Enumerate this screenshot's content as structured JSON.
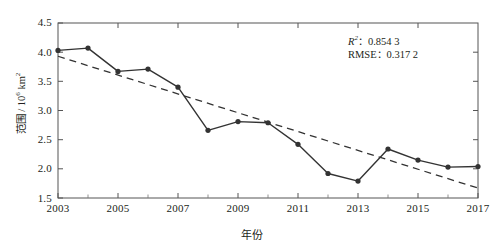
{
  "chart_data": {
    "type": "line",
    "title": "",
    "subtitle": "",
    "xlabel": "年份",
    "ylabel": "范围 / 10⁶ km²",
    "ylabel_parts": {
      "text": "范围 / 10",
      "exp1": "6",
      "unit": " km",
      "exp2": "2"
    },
    "x": [
      2003,
      2004,
      2005,
      2006,
      2007,
      2008,
      2009,
      2010,
      2011,
      2012,
      2013,
      2014,
      2015,
      2016,
      2017
    ],
    "values": [
      4.03,
      4.07,
      3.67,
      3.71,
      3.4,
      2.66,
      2.81,
      2.79,
      2.42,
      1.92,
      1.79,
      2.34,
      2.15,
      2.03,
      2.04
    ],
    "series": [
      {
        "name": "范围",
        "style": "solid-markers",
        "color": "#333333",
        "values": [
          4.03,
          4.07,
          3.67,
          3.71,
          3.4,
          2.66,
          2.81,
          2.79,
          2.42,
          1.92,
          1.79,
          2.34,
          2.15,
          2.03,
          2.04
        ]
      },
      {
        "name": "线性趋势线",
        "style": "dashed",
        "color": "#333333",
        "endpoints": [
          {
            "x": 2003,
            "y": 3.93
          },
          {
            "x": 2017,
            "y": 1.67
          }
        ]
      }
    ],
    "xlim": [
      2003,
      2017
    ],
    "ylim": [
      1.5,
      4.5
    ],
    "xticks": [
      2003,
      2005,
      2007,
      2009,
      2011,
      2013,
      2015,
      2017
    ],
    "xtick_labels": [
      "2003",
      "2005",
      "2007",
      "2009",
      "2011",
      "2013",
      "2015",
      "2017"
    ],
    "xminor_ticks": [
      2004,
      2006,
      2008,
      2010,
      2012,
      2014,
      2016
    ],
    "yticks": [
      1.5,
      2.0,
      2.5,
      3.0,
      3.5,
      4.0,
      4.5
    ],
    "ytick_labels": [
      "1.5",
      "2.0",
      "2.5",
      "3.0",
      "3.5",
      "4.0",
      "4.5"
    ],
    "grid": false,
    "legend": "none",
    "ticks_direction": "in",
    "frame": "box",
    "annotations": [
      {
        "name": "r-squared",
        "label": "R",
        "superscript": "2",
        "separator": "：",
        "value": "0.854 3"
      },
      {
        "name": "rmse",
        "label": "RMSE",
        "superscript": "",
        "separator": "：",
        "value": "0.317 2"
      }
    ]
  },
  "axis": {
    "y_label_full": "范围 / 10⁶ km²",
    "x_label_full": "年份"
  },
  "colors": {
    "line": "#333333",
    "marker": "#222222",
    "trend": "#333333",
    "frame": "#555555",
    "text": "#231f20",
    "background": "#ffffff"
  }
}
